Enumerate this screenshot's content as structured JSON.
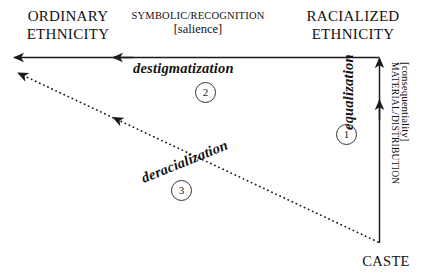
{
  "diagram": {
    "title_axes": {
      "left_pole": "ORDINARY\nETHNICITY",
      "left_pole_line1": "ORDINARY",
      "left_pole_line2": "ETHNICITY",
      "center_axis_line1": "SYMBOLIC/RECOGNITION",
      "center_axis_line2": "[salience]",
      "right_pole_line1": "RACIALIZED",
      "right_pole_line2": "ETHNICITY",
      "vertical_axis_line1": "MATERIAL/DISTRIBUTION",
      "vertical_axis_line2": "[consequentiality]",
      "origin_label": "CASTE"
    },
    "processes": [
      {
        "id": "2",
        "label": "destigmatization",
        "marker": "2"
      },
      {
        "id": "1",
        "label": "equalization",
        "marker": "1"
      },
      {
        "id": "3",
        "label": "deracialization",
        "marker": "3"
      }
    ],
    "markers": {
      "one": "1",
      "two": "2",
      "three": "3"
    },
    "colors": {
      "background": "#ffffff",
      "stroke": "#1a1a1a",
      "text": "#111111",
      "circle_stroke": "#333333"
    }
  }
}
